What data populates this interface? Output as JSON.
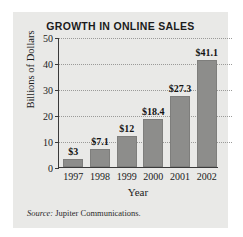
{
  "chart_data": {
    "type": "bar",
    "title": "GROWTH IN ONLINE SALES",
    "xlabel": "Year",
    "ylabel": "Billions of Dollars",
    "categories": [
      "1997",
      "1998",
      "1999",
      "2000",
      "2001",
      "2002"
    ],
    "values": [
      3,
      7.1,
      12,
      18.4,
      27.3,
      41.1
    ],
    "point_labels": [
      "$3",
      "$7.1",
      "$12",
      "$18.4",
      "$27.3",
      "$41.1"
    ],
    "ylim": [
      0,
      50
    ],
    "yticks": [
      0,
      10,
      20,
      30,
      40,
      50
    ],
    "ytick_labels": [
      "0",
      "10",
      "20",
      "30",
      "40",
      "50"
    ],
    "grid": "horizontal-dotted",
    "legend": "none",
    "bar_color": "#8d8d8b",
    "panel_color": "#e9e9e7",
    "axis_color": "#3a3a3a"
  },
  "source": {
    "prefix": "Source:",
    "text": "Jupiter Communications."
  }
}
